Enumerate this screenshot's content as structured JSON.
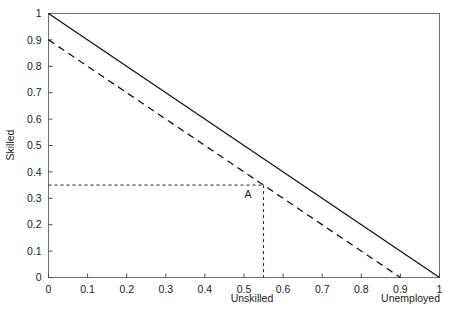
{
  "chart_data": {
    "type": "line",
    "title": "",
    "subtitle": "",
    "xlabel": "Unskilled",
    "xlabel_right": "Unemployed",
    "ylabel": "Skilled",
    "xlim": [
      0,
      1
    ],
    "ylim": [
      0,
      1
    ],
    "grid": false,
    "legend": "none",
    "x_ticks": [
      0,
      0.1,
      0.2,
      0.3,
      0.4,
      0.5,
      0.6,
      0.7,
      0.8,
      0.9,
      1
    ],
    "y_ticks": [
      0,
      0.1,
      0.2,
      0.3,
      0.4,
      0.5,
      0.6,
      0.7,
      0.8,
      0.9,
      1
    ],
    "x_tick_labels": [
      "0",
      "0.1",
      "0.2",
      "0.3",
      "0.4",
      "0.5",
      "0.6",
      "0.7",
      "0.8",
      "0.9",
      "1"
    ],
    "y_tick_labels": [
      "0",
      "0.1",
      "0.2",
      "0.3",
      "0.4",
      "0.5",
      "0.6",
      "0.7",
      "0.8",
      "0.9",
      "1"
    ],
    "series": [
      {
        "name": "solid-frontier",
        "style": "solid",
        "color": "#111111",
        "x": [
          0,
          1
        ],
        "values": [
          1,
          0
        ]
      },
      {
        "name": "dashed-frontier",
        "style": "dashed",
        "color": "#111111",
        "x": [
          0,
          0.9
        ],
        "values": [
          0.9,
          0
        ]
      }
    ],
    "annotations": [
      {
        "name": "point-A",
        "label": "A",
        "x": 0.55,
        "y": 0.35,
        "label_x": 0.51,
        "label_y": 0.3,
        "guides": {
          "horizontal_from_x": 0,
          "vertical_to_y": 0
        }
      }
    ]
  },
  "axes": {
    "y_title": "Skilled",
    "x_title_center": "Unskilled",
    "x_title_right": "Unemployed"
  }
}
